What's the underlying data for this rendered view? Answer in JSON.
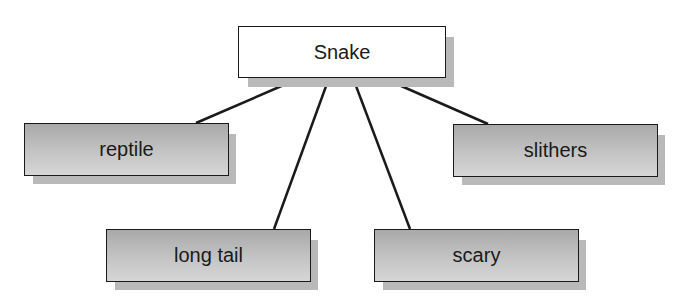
{
  "diagram": {
    "type": "concept-map",
    "root": {
      "label": "Snake"
    },
    "children": [
      {
        "label": "reptile"
      },
      {
        "label": "long tail"
      },
      {
        "label": "scary"
      },
      {
        "label": "slithers"
      }
    ],
    "colors": {
      "root_fill": "#ffffff",
      "child_fill": "#bdbdbd",
      "shadow": "#b9b9b9",
      "line": "#1a1a1a"
    }
  }
}
